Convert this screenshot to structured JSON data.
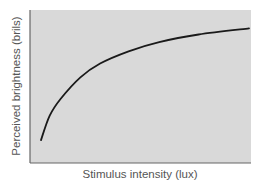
{
  "chart_data": {
    "type": "line",
    "title": "",
    "xlabel": "Stimulus intensity (lux)",
    "ylabel": "Perceived brightness (brils)",
    "xticks": [],
    "yticks": [],
    "grid": false,
    "legend": null,
    "series": [
      {
        "name": "Perceived brightness",
        "description": "Concave, logarithmic-like increasing curve",
        "x": [
          0.05,
          0.09,
          0.14,
          0.23,
          0.32,
          0.45,
          0.59,
          0.77,
          1.0
        ],
        "y": [
          0.15,
          0.31,
          0.42,
          0.56,
          0.65,
          0.73,
          0.79,
          0.84,
          0.88
        ]
      }
    ],
    "xlim": [
      0,
      1
    ],
    "ylim": [
      0,
      1
    ],
    "colors": {
      "plot_background": "#d9d9d9",
      "line": "#1a1a1a",
      "axis": "#666666",
      "label_text": "#555555"
    }
  }
}
